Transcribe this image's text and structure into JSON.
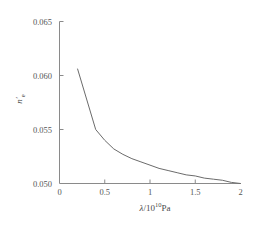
{
  "chart_data": {
    "type": "line",
    "title": "",
    "subtitle": "",
    "xlabel": "λ/10¹⁰Pa",
    "xlabel_symbol": "λ",
    "xlabel_mantissa": "/10",
    "xlabel_exponent": "10",
    "xlabel_unit": "Pa",
    "ylabel": "n'ₑ",
    "ylabel_symbol": "n",
    "ylabel_prime": "′",
    "ylabel_subscript": "e",
    "xlim": [
      0,
      2.0
    ],
    "ylim": [
      0.05,
      0.065
    ],
    "xticks": [
      0,
      0.5,
      1,
      1.5,
      2
    ],
    "xtick_labels": [
      "0",
      "0.5",
      "1",
      "1.5",
      "2"
    ],
    "yticks": [
      0.05,
      0.055,
      0.06,
      0.065
    ],
    "ytick_labels": [
      "0.050",
      "0.055",
      "0.060",
      "0.065"
    ],
    "grid": false,
    "legend": false,
    "legend_position": "none",
    "line_color": "#6b6b6b",
    "axis_color": "#8a8a8a",
    "series": [
      {
        "name": "n'e vs lambda",
        "x": [
          0.2,
          0.4,
          0.5,
          0.6,
          0.7,
          0.8,
          0.9,
          1.0,
          1.1,
          1.2,
          1.3,
          1.4,
          1.5,
          1.6,
          1.7,
          1.8,
          1.9,
          2.0
        ],
        "y": [
          0.0606,
          0.055,
          0.054,
          0.0532,
          0.0527,
          0.0523,
          0.052,
          0.0517,
          0.0514,
          0.0512,
          0.051,
          0.0508,
          0.0507,
          0.0505,
          0.0504,
          0.0503,
          0.0501,
          0.05
        ]
      }
    ],
    "annotations": []
  },
  "axes": {
    "x_title_parts": {
      "symbol": "λ",
      "slash_base": "/10",
      "exponent": "10",
      "unit": "Pa"
    },
    "y_title_parts": {
      "symbol": "n",
      "prime": "′",
      "subscript": "e"
    }
  }
}
